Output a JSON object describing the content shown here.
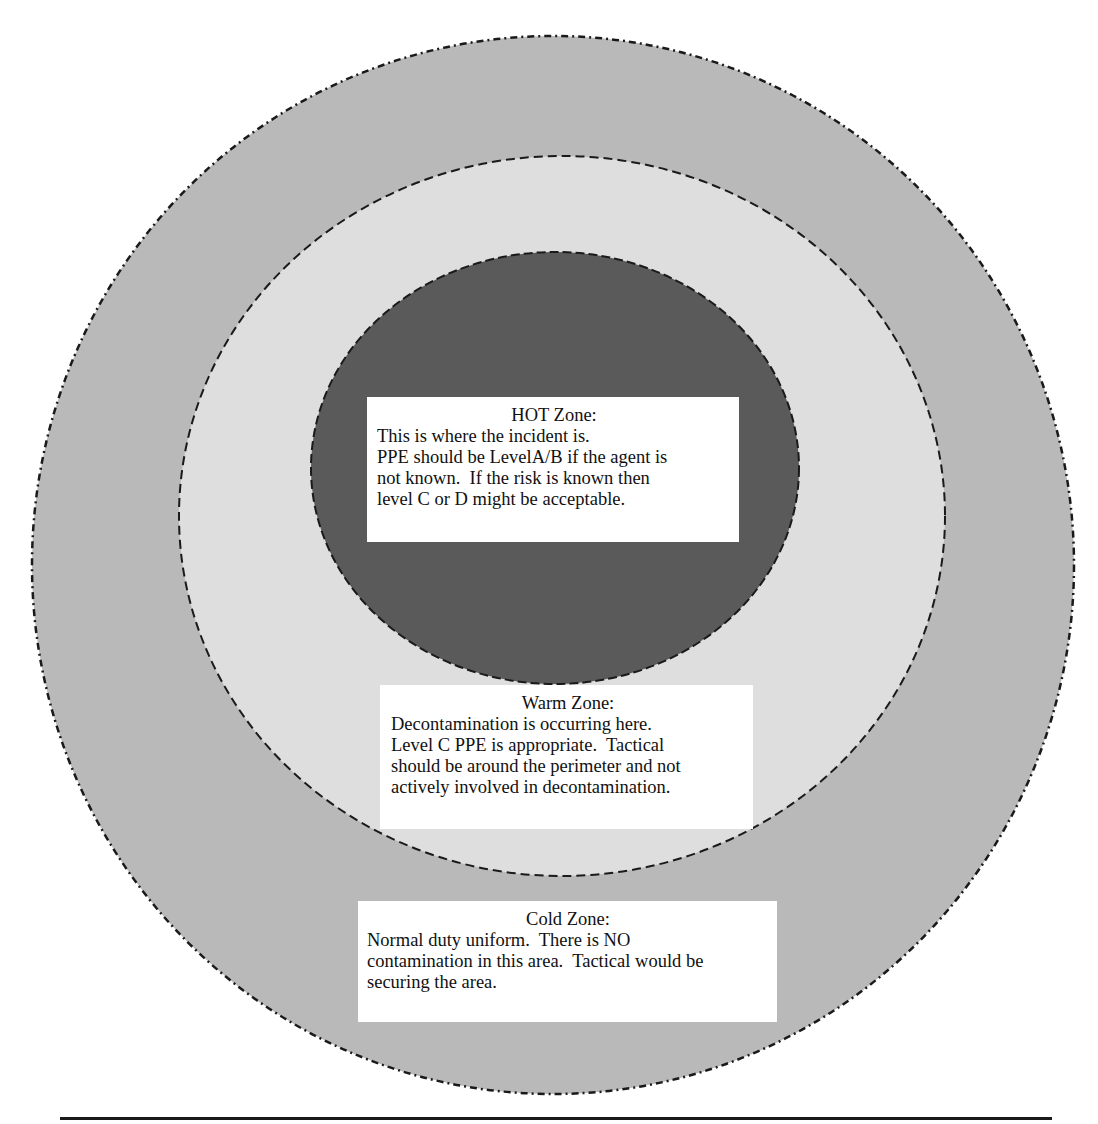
{
  "diagram": {
    "colors": {
      "cold_fill": "#b9b9b9",
      "warm_fill": "#dedede",
      "hot_fill": "#5a5a5a",
      "border": "#1a1a1a",
      "box_fill": "#ffffff",
      "page_bg": "#ffffff"
    },
    "ellipses": {
      "cold": {
        "cx": 553,
        "cy": 565,
        "rx": 521,
        "ry": 529,
        "stroke": "dash-dot"
      },
      "warm": {
        "cx": 562,
        "cy": 516,
        "rx": 383,
        "ry": 360,
        "stroke": "dashed"
      },
      "hot": {
        "cx": 555,
        "cy": 468,
        "rx": 244,
        "ry": 216,
        "stroke": "dashed"
      }
    },
    "zones": {
      "hot": {
        "title": "HOT Zone:",
        "lines": [
          "This is where the incident is.",
          "PPE should be LevelA/B if the agent is",
          "not known.  If the risk is known then",
          "level C or D might be acceptable."
        ]
      },
      "warm": {
        "title": "Warm Zone:",
        "lines": [
          "Decontamination is occurring here.",
          "Level C PPE is appropriate.  Tactical",
          "should be around the perimeter and not",
          "actively involved in decontamination."
        ]
      },
      "cold": {
        "title": "Cold Zone:",
        "lines": [
          "Normal duty uniform.  There is NO",
          "contamination in this area.  Tactical would be",
          "securing the area."
        ]
      }
    }
  }
}
